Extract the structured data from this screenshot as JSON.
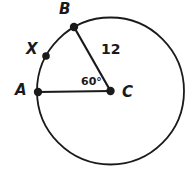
{
  "figure": {
    "type": "circle-geometry-diagram",
    "background_color": "#ffffff",
    "stroke_color": "#1a1a1a",
    "label_color": "#1a1a1a",
    "circle": {
      "center_x": 110.5,
      "center_y": 91,
      "radius": 73.5,
      "stroke_width": 1.8
    },
    "points": [
      {
        "name": "A",
        "label": "A",
        "x": 38,
        "y": 92,
        "dot_radius": 4.2,
        "label_x": 15,
        "label_y": 83
      },
      {
        "name": "B",
        "label": "B",
        "x": 74,
        "y": 27,
        "dot_radius": 4.2,
        "label_x": 59,
        "label_y": 2
      },
      {
        "name": "X",
        "label": "X",
        "x": 46,
        "y": 56,
        "dot_radius": 3.8,
        "label_x": 26,
        "label_y": 42
      },
      {
        "name": "C",
        "label": "C",
        "x": 110.5,
        "y": 91,
        "dot_radius": 4.2,
        "label_x": 122,
        "label_y": 85
      }
    ],
    "segments": [
      {
        "name": "radius-CA",
        "from": "C",
        "to": "A",
        "x1": 110.5,
        "y1": 91,
        "x2": 38,
        "y2": 92,
        "stroke_width": 2.2
      },
      {
        "name": "radius-CB",
        "from": "C",
        "to": "B",
        "x1": 110.5,
        "y1": 91,
        "x2": 74,
        "y2": 27,
        "stroke_width": 2.2
      }
    ],
    "measures": {
      "radius_length_label": "12",
      "central_angle_label": "60°",
      "central_angle_degrees": 60
    }
  }
}
